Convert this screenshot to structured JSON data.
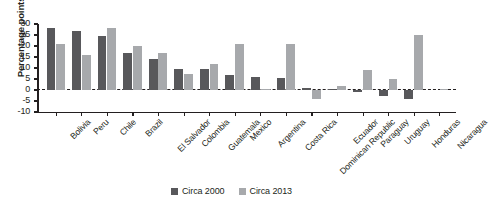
{
  "chart_data": {
    "type": "bar",
    "title": "",
    "subtitle": "",
    "xlabel": "",
    "ylabel": "Percentage points",
    "ylim": [
      -10,
      30
    ],
    "ytick_values": [
      30,
      25,
      20,
      15,
      10,
      5,
      0,
      -5,
      -10
    ],
    "ytick_labels": [
      "30",
      "25",
      "20",
      "15",
      "10",
      "5",
      "0",
      "-5",
      "-10"
    ],
    "grid": false,
    "legend_position": "bottom-center",
    "zero_line": true,
    "categories": [
      "Bolivia",
      "Peru",
      "Chile",
      "Brazil",
      "El Salvador",
      "Colombia",
      "Guatemala",
      "Mexico",
      "Argentina",
      "Costa Rica",
      "Dominican Republic",
      "Ecuador",
      "Paraguay",
      "Uruguay",
      "Honduras",
      "Nicaragua"
    ],
    "series": [
      {
        "name": "Circa 2000",
        "color": "#58585b",
        "values": [
          28,
          27,
          24.5,
          17,
          14,
          9.5,
          9.5,
          7,
          6,
          5.5,
          1,
          0.3,
          -1,
          -2.5,
          -4,
          0
        ]
      },
      {
        "name": "Circa 2013",
        "color": "#a7a9ac",
        "values": [
          21,
          16,
          28,
          20,
          17,
          7.5,
          12,
          21,
          0.5,
          21,
          -4,
          2,
          9,
          5,
          25,
          0.5
        ]
      }
    ]
  },
  "legend": {
    "items": [
      {
        "label": "Circa 2000",
        "color": "#58585b"
      },
      {
        "label": "Circa 2013",
        "color": "#a7a9ac"
      }
    ]
  }
}
